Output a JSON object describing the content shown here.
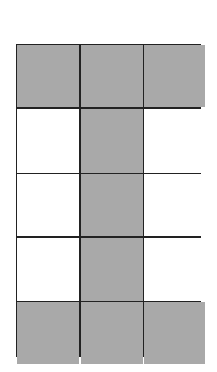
{
  "diagram": {
    "type": "grid",
    "rows": 5,
    "columns": 3,
    "colors": {
      "filled": "#a9a9a9",
      "empty": "#ffffff",
      "border": "#222222"
    },
    "cells": [
      [
        true,
        true,
        true
      ],
      [
        false,
        true,
        false
      ],
      [
        false,
        true,
        false
      ],
      [
        false,
        true,
        false
      ],
      [
        true,
        true,
        true
      ]
    ]
  }
}
